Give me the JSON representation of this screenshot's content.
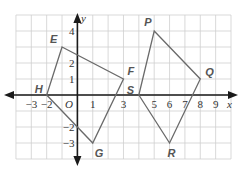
{
  "diagram": {
    "type": "coordinate-plane",
    "grid": {
      "x_min": -4,
      "x_max": 10,
      "y_min": -4,
      "y_max": 5
    },
    "axes": {
      "x_label": "x",
      "y_label": "y",
      "origin_label": "O",
      "x_ticks": [
        {
          "value": -3,
          "label": "−3"
        },
        {
          "value": -2,
          "label": "−2"
        },
        {
          "value": 1,
          "label": "1"
        },
        {
          "value": 3,
          "label": "3"
        },
        {
          "value": 5,
          "label": "5"
        },
        {
          "value": 6,
          "label": "6"
        },
        {
          "value": 7,
          "label": "7"
        },
        {
          "value": 8,
          "label": "8"
        },
        {
          "value": 9,
          "label": "9"
        }
      ],
      "y_ticks": [
        {
          "value": 4,
          "label": "4"
        },
        {
          "value": 2,
          "label": "2"
        },
        {
          "value": 1,
          "label": "1"
        },
        {
          "value": -2,
          "label": "−2"
        },
        {
          "value": -3,
          "label": "−3"
        }
      ]
    },
    "polygons": [
      {
        "name": "EFGH",
        "vertices": [
          {
            "label": "E",
            "x": -1,
            "y": 3
          },
          {
            "label": "F",
            "x": 3,
            "y": 1
          },
          {
            "label": "G",
            "x": 1,
            "y": -3
          },
          {
            "label": "H",
            "x": -2,
            "y": 0
          }
        ]
      },
      {
        "name": "PQRS",
        "vertices": [
          {
            "label": "P",
            "x": 5,
            "y": 4
          },
          {
            "label": "Q",
            "x": 8,
            "y": 1
          },
          {
            "label": "R",
            "x": 6,
            "y": -3
          },
          {
            "label": "S",
            "x": 4,
            "y": 0
          }
        ]
      }
    ],
    "colors": {
      "grid": "#cfcfcf",
      "axis": "#1a1a1a",
      "polygon": "#6a6a6a",
      "point_label": "#555555"
    }
  }
}
